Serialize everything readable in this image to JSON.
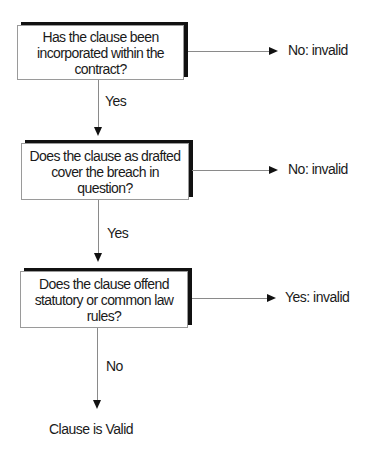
{
  "flowchart": {
    "questions": [
      {
        "text": "Has the clause been incorporated within the contract?",
        "side_outcome": "No: invalid",
        "down_label": "Yes"
      },
      {
        "text": "Does the clause as drafted cover the breach in question?",
        "side_outcome": "No: invalid",
        "down_label": "Yes"
      },
      {
        "text": "Does the clause offend statutory or common law rules?",
        "side_outcome": "Yes: invalid",
        "down_label": "No"
      }
    ],
    "final_outcome": "Clause is Valid"
  }
}
